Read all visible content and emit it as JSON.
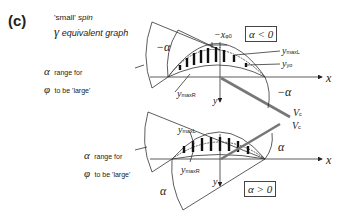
{
  "figure": {
    "panel_label": "(c)",
    "caption_line1_quote": "'small'",
    "caption_line1_rest": " spin",
    "caption_line2_symbol": "γ",
    "caption_line2_rest": " equivalent graph"
  },
  "top_diagram": {
    "condition": "α < 0",
    "range_symbol1": "α",
    "range_text1": "range for",
    "range_symbol2": "φ",
    "range_text2": "to be 'large'",
    "angle_label_1": "−α",
    "angle_label_2": "−α",
    "offset_label": "−x",
    "offset_sub": "φ0",
    "curve_upper": "y",
    "curve_upper_sub": "maxL",
    "curve_mid": "y",
    "curve_mid_sub": "yo",
    "curve_lower": "y",
    "curve_lower_sub": "maxR",
    "x_axis": "x",
    "y_axis": "y",
    "velocity": "V",
    "velocity_sub": "c"
  },
  "bottom_diagram": {
    "condition": "α > 0",
    "range_symbol1": "α",
    "range_text1": "range for",
    "range_symbol2": "φ",
    "range_text2": "to be 'large'",
    "angle_label_1": "α",
    "angle_label_2": "α",
    "curve_upper": "y",
    "curve_upper_sub": "maxL",
    "curve_lower": "y",
    "curve_lower_sub": "maxR",
    "x_axis": "x",
    "y_axis": "y",
    "velocity": "V",
    "velocity_sub": "c"
  }
}
